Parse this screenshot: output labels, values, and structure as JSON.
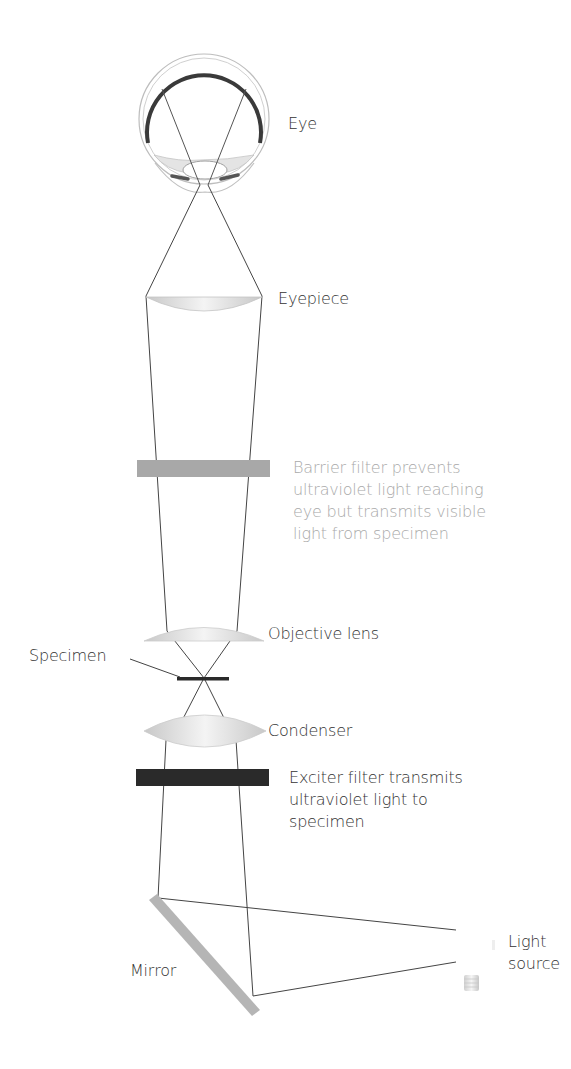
{
  "diagram": {
    "colors": {
      "line": "#444444",
      "lens_fill": "#d4d4d4",
      "barrier_filter": "#a8a8a8",
      "exciter_filter": "#2a2a2a",
      "mirror": "#b5b5b5",
      "muted_text": "#a9a9a9",
      "text": "#333333"
    },
    "labels": {
      "eye": "Eye",
      "eyepiece": "Eyepiece",
      "barrier_filter": [
        "Barrier filter prevents",
        "ultraviolet light reaching",
        "eye but transmits visible",
        "light from specimen"
      ],
      "objective_lens": "Objective lens",
      "specimen": "Specimen",
      "condenser": "Condenser",
      "exciter_filter": [
        "Exciter filter transmits",
        "ultraviolet light to",
        "specimen"
      ],
      "mirror": "Mirror",
      "light_source": [
        "Light",
        "source"
      ]
    }
  }
}
